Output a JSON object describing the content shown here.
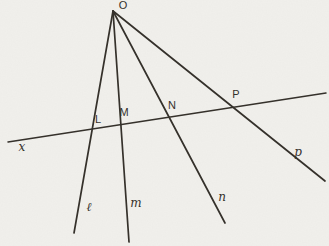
{
  "figure": {
    "width": 329,
    "height": 246,
    "colors": {
      "paper": "#f1f0ec",
      "ink": "#35312b"
    },
    "vertex": {
      "label": "O",
      "x": 113,
      "y": 11
    },
    "rays": [
      {
        "id": "ray-l",
        "from": {
          "x": 113,
          "y": 11
        },
        "to": {
          "x": 74,
          "y": 233
        }
      },
      {
        "id": "ray-m",
        "from": {
          "x": 113,
          "y": 11
        },
        "to": {
          "x": 129,
          "y": 242
        }
      },
      {
        "id": "ray-n",
        "from": {
          "x": 113,
          "y": 11
        },
        "to": {
          "x": 225,
          "y": 223
        }
      },
      {
        "id": "ray-p",
        "from": {
          "x": 113,
          "y": 11
        },
        "to": {
          "x": 325,
          "y": 181
        }
      }
    ],
    "transversal": {
      "id": "line-x",
      "from": {
        "x": 8,
        "y": 142
      },
      "to": {
        "x": 326,
        "y": 93
      }
    },
    "labels": [
      {
        "text": "O",
        "x": 123,
        "y": 6,
        "style": "upright",
        "name": "vertex-label-O"
      },
      {
        "text": "L",
        "x": 98,
        "y": 120,
        "style": "upright",
        "name": "point-label-L"
      },
      {
        "text": "M",
        "x": 124,
        "y": 113,
        "style": "upright",
        "name": "point-label-M"
      },
      {
        "text": "N",
        "x": 172,
        "y": 106,
        "style": "upright",
        "name": "point-label-N"
      },
      {
        "text": "P",
        "x": 236,
        "y": 95,
        "style": "upright",
        "name": "point-label-P"
      },
      {
        "text": "x",
        "x": 22,
        "y": 147,
        "style": "italic",
        "name": "line-label-x"
      },
      {
        "text": "ℓ",
        "x": 89,
        "y": 207,
        "style": "italic",
        "name": "line-label-l"
      },
      {
        "text": "m",
        "x": 136,
        "y": 203,
        "style": "italic",
        "name": "line-label-m"
      },
      {
        "text": "n",
        "x": 222,
        "y": 197,
        "style": "italic",
        "name": "line-label-n"
      },
      {
        "text": "p",
        "x": 298,
        "y": 152,
        "style": "italic",
        "name": "line-label-p"
      }
    ]
  }
}
